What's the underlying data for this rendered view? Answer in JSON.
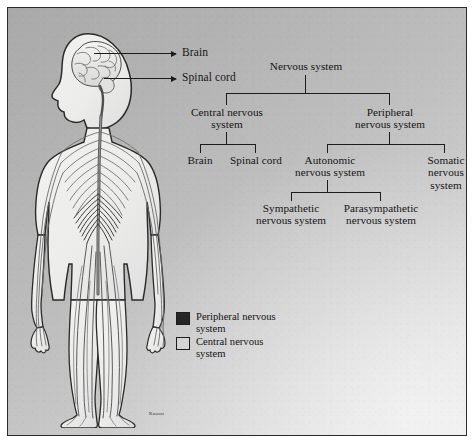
{
  "figure": {
    "signature": "Kausat"
  },
  "anatomy": {
    "alt": "human-body-nervous-system-illustration",
    "callouts": [
      {
        "label": "Brain",
        "target": "brain"
      },
      {
        "label": "Spinal cord",
        "target": "spinal-cord"
      }
    ]
  },
  "tree": {
    "root": "Nervous system",
    "level1": [
      "Central nervous system",
      "Peripheral nervous system"
    ],
    "central_children": [
      "Brain",
      "Spinal cord"
    ],
    "peripheral_children": [
      "Autonomic nervous system",
      "Somatic nervous system"
    ],
    "autonomic_children": [
      "Sympathetic nervous system",
      "Parasympathetic nervous system"
    ]
  },
  "legend": {
    "items": [
      {
        "label": "Peripheral nervous system",
        "color": "#252525",
        "fill": "solid"
      },
      {
        "label": "Central nervous system",
        "color": "#d5d5d5",
        "fill": "outline"
      }
    ]
  },
  "colors": {
    "background_dark": "#a9a9a9",
    "background_light": "#e6e6e6",
    "ink": "#1c1c1c",
    "peripheral": "#252525",
    "central": "#d5d5d5"
  }
}
